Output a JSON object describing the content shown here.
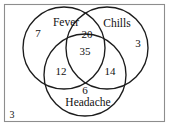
{
  "figure": {
    "type": "venn-diagram",
    "sets_count": 3,
    "stroke_color": "#1c1c1c",
    "rect_color": "#8d8d8d",
    "background": "#ffffff"
  },
  "sets": [
    {
      "key": "fever",
      "label": "Fever",
      "label_x": 66,
      "label_y": 23
    },
    {
      "key": "chills",
      "label": "Chills",
      "label_x": 117,
      "label_y": 24
    },
    {
      "key": "headache",
      "label": "Headache",
      "label_x": 88,
      "label_y": 103
    }
  ],
  "regions": [
    {
      "key": "fever_only",
      "value": "7",
      "x": 38,
      "y": 33
    },
    {
      "key": "chills_only",
      "value": "3",
      "x": 138,
      "y": 43
    },
    {
      "key": "fever_chills",
      "value": "20",
      "x": 87,
      "y": 34
    },
    {
      "key": "all_three",
      "value": "35",
      "x": 85,
      "y": 51
    },
    {
      "key": "fever_headache",
      "value": "12",
      "x": 61,
      "y": 71
    },
    {
      "key": "chills_headache",
      "value": "14",
      "x": 110,
      "y": 71
    },
    {
      "key": "headache_only",
      "value": "6",
      "x": 85,
      "y": 90
    },
    {
      "key": "outside_all",
      "value": "3",
      "x": 12,
      "y": 115
    }
  ],
  "geometry": {
    "rect": {
      "x": 4,
      "y": 4,
      "width": 161,
      "height": 118
    },
    "circles": [
      {
        "key": "fever",
        "cx": 64,
        "cy": 48,
        "r": 41
      },
      {
        "key": "chills",
        "cx": 107,
        "cy": 48,
        "r": 41
      },
      {
        "key": "headache",
        "cx": 85,
        "cy": 75,
        "r": 41
      }
    ]
  }
}
